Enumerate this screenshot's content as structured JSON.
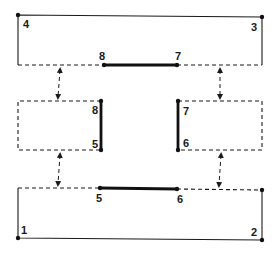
{
  "diagram": {
    "nodes": [
      {
        "id": "1",
        "label": "1"
      },
      {
        "id": "2",
        "label": "2"
      },
      {
        "id": "3",
        "label": "3"
      },
      {
        "id": "4",
        "label": "4"
      },
      {
        "id": "5",
        "label": "5"
      },
      {
        "id": "6",
        "label": "6"
      },
      {
        "id": "7",
        "label": "7"
      },
      {
        "id": "8",
        "label": "8"
      }
    ],
    "labels": {
      "n1": "1",
      "n2": "2",
      "n3": "3",
      "n4": "4",
      "n5_mid": "5",
      "n5_bot": "5",
      "n6_mid": "6",
      "n6_bot": "6",
      "n7_top": "7",
      "n7_mid": "7",
      "n8_top": "8",
      "n8_mid": "8"
    },
    "bold_members": [
      [
        "8",
        "7"
      ],
      [
        "8",
        "5"
      ],
      [
        "7",
        "6"
      ],
      [
        "5",
        "6"
      ]
    ],
    "connections": [
      {
        "from": "top-frame",
        "to": "middle-left-frame",
        "style": "dashed double arrow"
      },
      {
        "from": "top-frame",
        "to": "middle-right-frame",
        "style": "dashed double arrow"
      },
      {
        "from": "middle-left-frame",
        "to": "bottom-frame",
        "style": "dashed double arrow"
      },
      {
        "from": "middle-right-frame",
        "to": "bottom-frame",
        "style": "dashed double arrow"
      }
    ]
  }
}
